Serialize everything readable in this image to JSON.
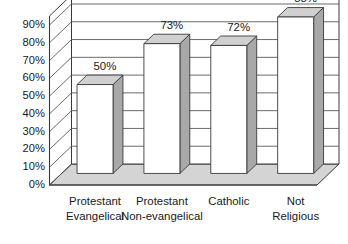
{
  "chart_data": {
    "type": "bar",
    "title": "",
    "subtitle": "",
    "xlabel": "",
    "ylabel": "",
    "categories": [
      "Protestant Evangelical",
      "Protestant Non-evangelical",
      "Catholic",
      "Not Religious"
    ],
    "category_lines": [
      [
        "Protestant",
        "Evangelical"
      ],
      [
        "Protestant",
        "Non-evangelical"
      ],
      [
        "Catholic",
        ""
      ],
      [
        "Not",
        "Religious"
      ]
    ],
    "values": [
      50,
      73,
      72,
      88
    ],
    "value_labels": [
      "50%",
      "73%",
      "72%",
      "88%"
    ],
    "ylim": [
      0,
      90
    ],
    "ytick_values": [
      0,
      10,
      20,
      30,
      40,
      50,
      60,
      70,
      80,
      90
    ],
    "ytick_labels": [
      "0%",
      "10%",
      "20%",
      "30%",
      "40%",
      "50%",
      "60%",
      "70%",
      "80%",
      "90%"
    ],
    "grid": true,
    "grid_axis": "y",
    "legend": false,
    "legend_position": "none",
    "style": "3d-column",
    "colors": {
      "bar_front": "#ffffff",
      "bar_top": "#d0d0d0",
      "bar_side": "#a8a8a8",
      "floor": "#d4d4d4",
      "wall": "#ffffff",
      "outline": "#3a3a3a",
      "gridline": "#5a5a5a",
      "text": "#1a1a1a"
    }
  }
}
